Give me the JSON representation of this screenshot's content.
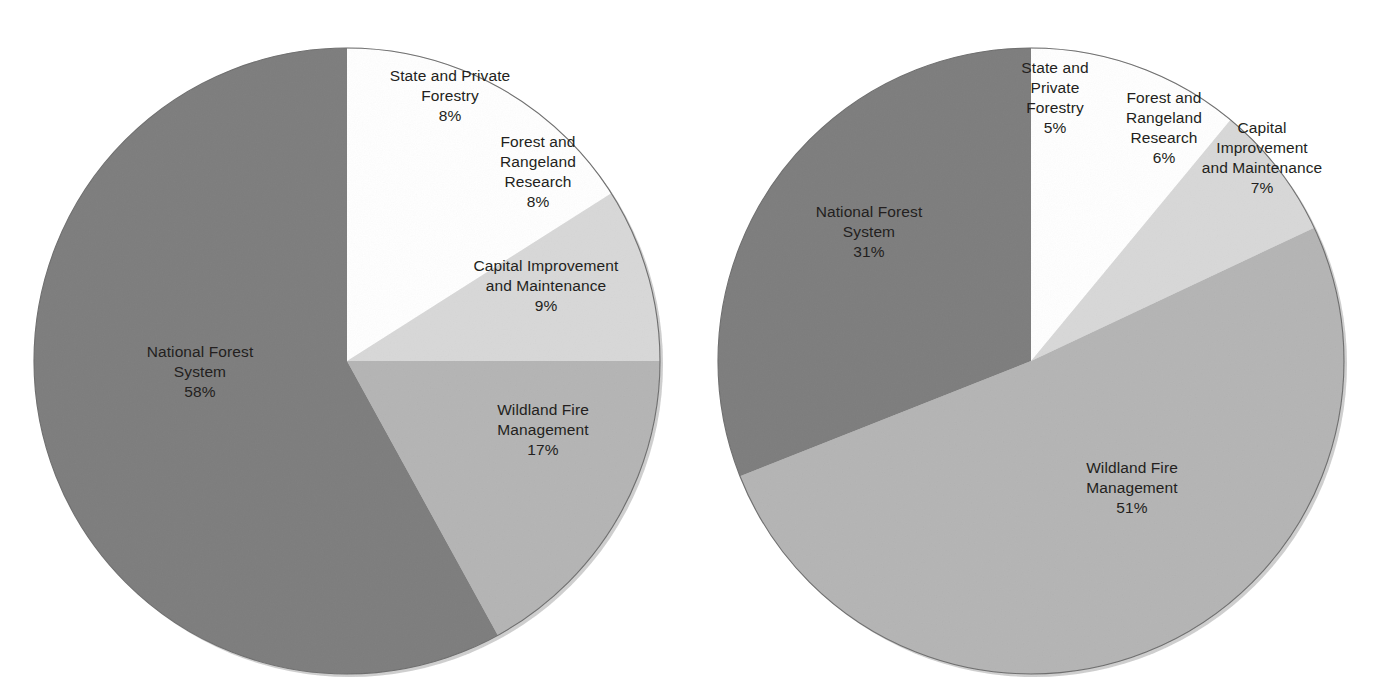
{
  "chart_data": [
    {
      "type": "pie",
      "id": "left-pie",
      "title": "",
      "categories": [
        "State and Private Forestry",
        "Forest and Rangeland Research",
        "Capital Improvement and Maintenance",
        "Wildland Fire Management",
        "National Forest System"
      ],
      "values": [
        8,
        8,
        9,
        17,
        58
      ],
      "value_labels": [
        "8%",
        "8%",
        "9%",
        "17%",
        "58%"
      ],
      "units": "percent",
      "start_angle_deg": 0,
      "direction": "clockwise",
      "legend": "none",
      "labels_position": "inside-slice",
      "slice_colors": [
        "#ffffff",
        "#ffffff",
        "#ebebeb",
        "#d7d7d7",
        "#b4b4b4"
      ],
      "slices": [
        {
          "name": "State and Private Forestry",
          "name_lines": [
            "State and Private",
            "Forestry"
          ],
          "pct": "8%",
          "value": 8,
          "color": "#ffffff"
        },
        {
          "name": "Forest and Rangeland Research",
          "name_lines": [
            "Forest and",
            "Rangeland",
            "Research"
          ],
          "pct": "8%",
          "value": 8,
          "color": "#ffffff"
        },
        {
          "name": "Capital Improvement and Maintenance",
          "name_lines": [
            "Capital Improvement",
            "and Maintenance"
          ],
          "pct": "9%",
          "value": 9,
          "color": "#ebebeb"
        },
        {
          "name": "Wildland Fire Management",
          "name_lines": [
            "Wildland Fire",
            "Management"
          ],
          "pct": "17%",
          "value": 17,
          "color": "#d7d7d7"
        },
        {
          "name": "National Forest System",
          "name_lines": [
            "National Forest",
            "System"
          ],
          "pct": "58%",
          "value": 58,
          "color": "#b4b4b4"
        }
      ]
    },
    {
      "type": "pie",
      "id": "right-pie",
      "title": "",
      "categories": [
        "State and Private Forestry",
        "Forest and Rangeland Research",
        "Capital Improvement and Maintenance",
        "Wildland Fire Management",
        "National Forest System"
      ],
      "values": [
        5,
        6,
        7,
        51,
        31
      ],
      "value_labels": [
        "5%",
        "6%",
        "7%",
        "51%",
        "31%"
      ],
      "units": "percent",
      "start_angle_deg": 0,
      "direction": "clockwise",
      "legend": "none",
      "labels_position": "inside-slice",
      "slice_colors": [
        "#ffffff",
        "#ffffff",
        "#ebebeb",
        "#d7d7d7",
        "#b4b4b4"
      ],
      "slices": [
        {
          "name": "State and Private Forestry",
          "name_lines": [
            "State and",
            "Private",
            "Forestry"
          ],
          "pct": "5%",
          "value": 5,
          "color": "#ffffff"
        },
        {
          "name": "Forest and Rangeland Research",
          "name_lines": [
            "Forest and",
            "Rangeland",
            "Research"
          ],
          "pct": "6%",
          "value": 6,
          "color": "#ffffff"
        },
        {
          "name": "Capital Improvement and Maintenance",
          "name_lines": [
            "Capital",
            "Improvement",
            "and Maintenance"
          ],
          "pct": "7%",
          "value": 7,
          "color": "#ebebeb"
        },
        {
          "name": "Wildland Fire Management",
          "name_lines": [
            "Wildland Fire",
            "Management"
          ],
          "pct": "51%",
          "value": 51,
          "color": "#d7d7d7"
        },
        {
          "name": "National Forest System",
          "name_lines": [
            "National Forest",
            "System"
          ],
          "pct": "31%",
          "value": 31,
          "color": "#b4b4b4"
        }
      ]
    }
  ],
  "left_chart": {
    "spf": {
      "l1": "State and Private",
      "l2": "Forestry",
      "pct": "8%"
    },
    "frr": {
      "l1": "Forest and",
      "l2": "Rangeland",
      "l3": "Research",
      "pct": "8%"
    },
    "cim": {
      "l1": "Capital Improvement",
      "l2": "and Maintenance",
      "pct": "9%"
    },
    "wfm": {
      "l1": "Wildland Fire",
      "l2": "Management",
      "pct": "17%"
    },
    "nfs": {
      "l1": "National Forest",
      "l2": "System",
      "pct": "58%"
    }
  },
  "right_chart": {
    "spf": {
      "l1": "State and",
      "l2": "Private",
      "l3": "Forestry",
      "pct": "5%"
    },
    "frr": {
      "l1": "Forest and",
      "l2": "Rangeland",
      "l3": "Research",
      "pct": "6%"
    },
    "cim": {
      "l1": "Capital",
      "l2": "Improvement",
      "l3": "and Maintenance",
      "pct": "7%"
    },
    "wfm": {
      "l1": "Wildland Fire",
      "l2": "Management",
      "pct": "51%"
    },
    "nfs": {
      "l1": "National Forest",
      "l2": "System",
      "pct": "31%"
    }
  },
  "colors": {
    "background": "#ffffff",
    "text": "#231f20",
    "slice_white": "#ffffff",
    "slice_lightest": "#ebebeb",
    "slice_light": "#d7d7d7",
    "slice_medium": "#b4b4b4",
    "outline": "#a7a7a7"
  }
}
